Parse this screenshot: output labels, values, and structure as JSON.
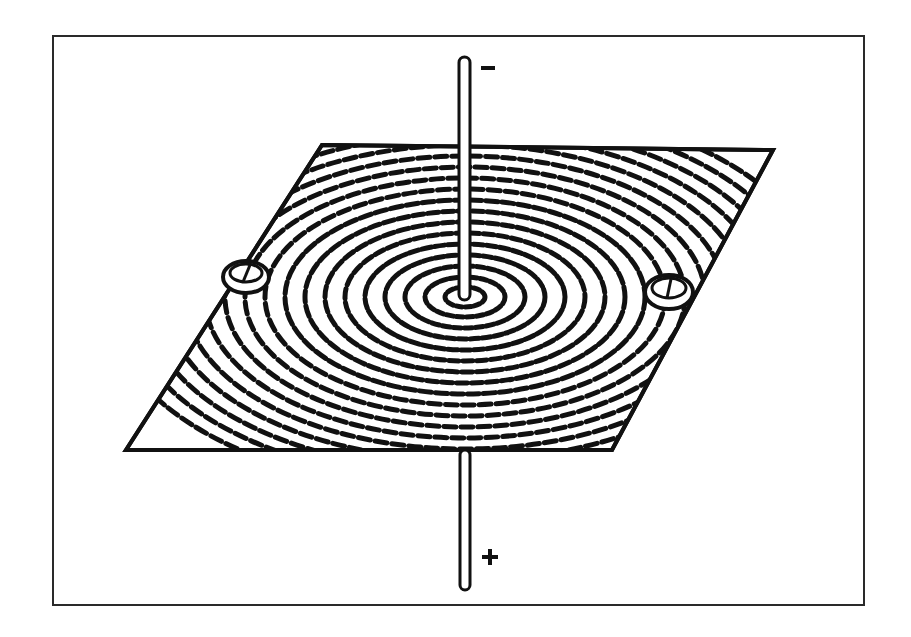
{
  "figure": {
    "type": "electric-field-illustration",
    "wire": {
      "top_sign": "−",
      "bottom_sign": "+"
    },
    "markers": [
      {
        "name": "left-compass",
        "x": 246,
        "y": 274
      },
      {
        "name": "right-compass",
        "x": 669,
        "y": 290
      }
    ],
    "colors": {
      "ink": "#111111",
      "paper": "#ffffff",
      "frame": "#2a2a2a"
    }
  }
}
